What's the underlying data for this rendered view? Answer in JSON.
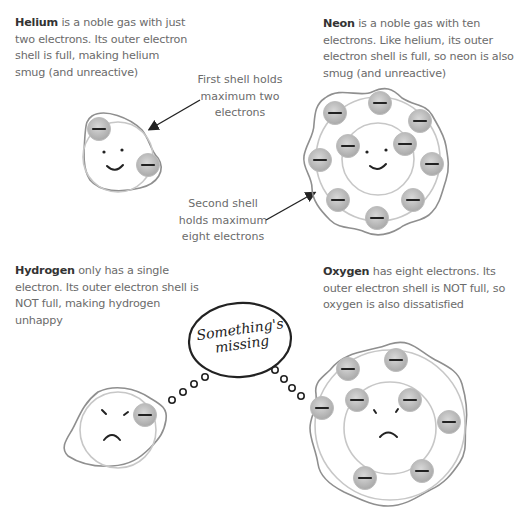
{
  "captions": {
    "helium": {
      "name": "Helium",
      "text": " is a noble gas with just two electrons. Its outer electron shell is full, making helium smug (and unreactive)"
    },
    "neon": {
      "name": "Neon",
      "text": " is a noble gas with ten electrons. Like helium, its outer electron shell is full, so neon is also smug (and unreactive)"
    },
    "hydrogen": {
      "name": "Hydrogen",
      "text": " only has a single electron. Its outer electron shell is NOT full, making hydrogen unhappy"
    },
    "oxygen": {
      "name": "Oxygen",
      "text": " has eight electrons. Its outer electron shell is NOT full, so oxygen is also dissatisfied"
    }
  },
  "notes": {
    "first_shell": "First shell holds maximum two electrons",
    "second_shell": "Second shell holds maximum eight electrons"
  },
  "thought_bubble": {
    "line1": "Something's",
    "line2": "missing"
  },
  "atoms": {
    "helium": {
      "electrons": 2,
      "mood": "smug"
    },
    "neon": {
      "electrons": 10,
      "mood": "smug"
    },
    "hydrogen": {
      "electrons": 1,
      "mood": "unhappy"
    },
    "oxygen": {
      "electrons": 8,
      "mood": "dissatisfied"
    }
  },
  "colors": {
    "shell": "#b5b5b5",
    "blob": "#8a8a8a",
    "electron": "#c4c4c4",
    "ink": "#222222",
    "text": "#6b6b6b"
  }
}
